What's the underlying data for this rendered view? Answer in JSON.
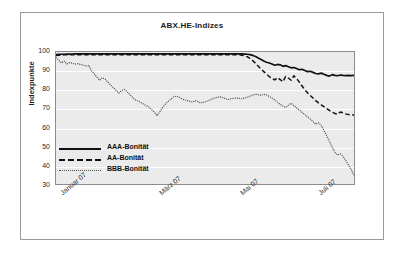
{
  "figure": {
    "title": "ABX.HE-Indizes"
  },
  "chart_data": {
    "type": "line",
    "title": "ABX.HE-Indizes",
    "xlabel": "",
    "ylabel": "Indexpunkte",
    "ylim": [
      30,
      100
    ],
    "yticks": [
      100,
      90,
      80,
      70,
      60,
      50,
      40,
      30
    ],
    "xticks": [
      "Januar 07",
      "März 07",
      "Mai 07",
      "Juli 07"
    ],
    "xtick_positions": [
      0.02,
      0.35,
      0.62,
      0.88
    ],
    "grid": "horizontal",
    "legend_position": "inside-lower-left",
    "colors": {
      "aaa": "#111111",
      "aa": "#111111",
      "bbb": "#4d4d4d",
      "plot_background": "#ebebeb",
      "gridline": "#ffffff",
      "frame": "#8c8c8c"
    },
    "series": [
      {
        "name": "AAA-Bonität",
        "style": "solid",
        "values": [
          98.6,
          98.7,
          98.8,
          98.8,
          98.9,
          98.9,
          98.9,
          99.0,
          99.0,
          99.0,
          99.0,
          99.0,
          99.0,
          99.0,
          99.0,
          99.0,
          99.0,
          99.0,
          99.0,
          99.0,
          99.0,
          99.0,
          99.0,
          99.0,
          99.0,
          99.0,
          99.0,
          99.0,
          99.0,
          99.0,
          99.0,
          99.0,
          99.0,
          99.0,
          99.0,
          99.0,
          99.0,
          99.0,
          99.0,
          99.0,
          99.0,
          99.0,
          99.0,
          99.0,
          99.0,
          99.0,
          99.0,
          99.0,
          99.0,
          99.0,
          99.0,
          99.0,
          99.0,
          99.0,
          99.0,
          99.0,
          99.0,
          99.0,
          99.0,
          99.0,
          99.0,
          99.0,
          99.0,
          99.0,
          99.0,
          99.0,
          99.0,
          99.0,
          99.0,
          98.9,
          98.8,
          98.6,
          98.2,
          97.6,
          96.8,
          96.0,
          95.2,
          94.6,
          94.2,
          93.6,
          93.0,
          93.4,
          93.2,
          92.4,
          92.8,
          92.2,
          91.6,
          91.8,
          91.2,
          90.6,
          90.8,
          90.2,
          89.6,
          89.8,
          89.2,
          88.6,
          88.4,
          88.8,
          88.2,
          87.6,
          87.2,
          88.0,
          87.6,
          87.4,
          87.8,
          87.6,
          87.5,
          87.6,
          87.5,
          87.6
        ]
      },
      {
        "name": "AA-Bonität",
        "style": "dashed",
        "values": [
          98.2,
          98.3,
          98.4,
          98.5,
          98.5,
          98.6,
          98.6,
          98.6,
          98.6,
          98.6,
          98.6,
          98.6,
          98.6,
          98.6,
          98.6,
          98.6,
          98.6,
          98.6,
          98.6,
          98.6,
          98.6,
          98.6,
          98.6,
          98.6,
          98.6,
          98.6,
          98.6,
          98.6,
          98.6,
          98.6,
          98.6,
          98.6,
          98.6,
          98.6,
          98.6,
          98.6,
          98.6,
          98.6,
          98.6,
          98.6,
          98.6,
          98.6,
          98.6,
          98.6,
          98.6,
          98.6,
          98.6,
          98.6,
          98.6,
          98.6,
          98.6,
          98.6,
          98.6,
          98.6,
          98.6,
          98.6,
          98.6,
          98.6,
          98.6,
          98.6,
          98.6,
          98.6,
          98.6,
          98.6,
          98.6,
          98.6,
          98.6,
          98.5,
          98.3,
          98.0,
          97.4,
          96.6,
          95.4,
          94.0,
          92.4,
          91.0,
          89.6,
          88.2,
          87.0,
          86.0,
          85.2,
          86.4,
          85.4,
          84.2,
          87.0,
          86.2,
          85.0,
          87.4,
          86.0,
          84.0,
          82.0,
          80.0,
          78.4,
          77.0,
          75.6,
          74.2,
          73.0,
          72.0,
          71.0,
          70.0,
          69.0,
          68.2,
          67.4,
          67.0,
          68.2,
          67.8,
          67.2,
          66.8,
          66.6,
          66.6
        ]
      },
      {
        "name": "BBB-Bonität",
        "style": "dotted",
        "values": [
          97.2,
          95.6,
          94.2,
          95.2,
          93.6,
          94.4,
          94.0,
          93.6,
          93.8,
          93.4,
          93.0,
          92.6,
          92.8,
          90.0,
          88.4,
          86.6,
          85.0,
          86.4,
          85.6,
          84.0,
          82.4,
          81.0,
          79.6,
          78.2,
          79.6,
          80.2,
          79.0,
          77.4,
          76.0,
          74.6,
          74.0,
          73.2,
          72.4,
          71.6,
          70.8,
          69.4,
          68.0,
          66.2,
          68.4,
          70.6,
          72.4,
          73.8,
          75.0,
          76.2,
          76.6,
          76.0,
          75.2,
          74.6,
          74.2,
          73.8,
          73.4,
          74.2,
          73.6,
          73.0,
          73.4,
          73.8,
          74.4,
          75.0,
          75.6,
          76.0,
          76.2,
          75.8,
          75.2,
          74.8,
          75.2,
          75.4,
          75.6,
          75.4,
          75.2,
          75.6,
          76.0,
          76.6,
          77.2,
          77.6,
          77.4,
          77.0,
          77.6,
          77.2,
          76.4,
          75.6,
          74.6,
          73.4,
          72.2,
          71.4,
          70.6,
          71.8,
          72.8,
          71.6,
          70.4,
          69.2,
          68.0,
          66.8,
          65.6,
          64.4,
          63.2,
          61.6,
          62.6,
          61.0,
          58.4,
          55.6,
          52.6,
          49.6,
          46.8,
          45.4,
          46.0,
          44.6,
          42.4,
          40.0,
          37.6,
          34.4
        ]
      }
    ]
  },
  "axes": {
    "y_tick_labels": [
      "100",
      "90",
      "80",
      "70",
      "60",
      "50",
      "40",
      "30"
    ],
    "y_title": "Indexpunkte",
    "x_tick_labels": [
      "Januar 07",
      "März 07",
      "Mai 07",
      "Juli 07"
    ]
  },
  "legend": {
    "entries": [
      {
        "label": "AAA-Bonität",
        "style": "solid"
      },
      {
        "label": "AA-Bonität",
        "style": "dashed"
      },
      {
        "label": "BBB-Bonität",
        "style": "dotted"
      }
    ]
  }
}
